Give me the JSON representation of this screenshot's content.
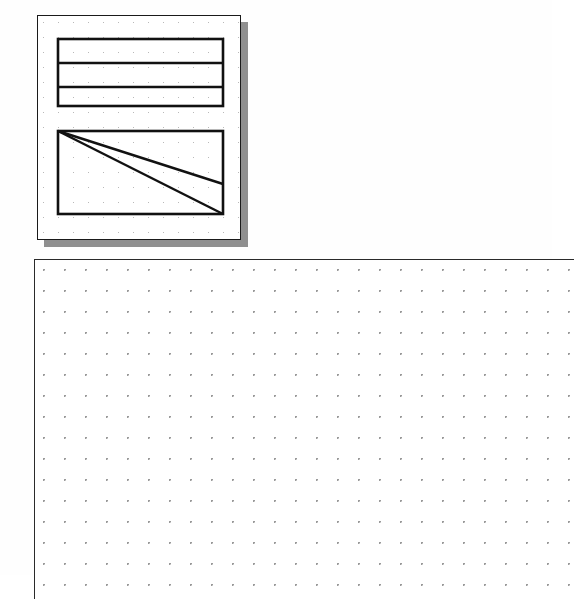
{
  "document": {
    "title": "Drafting Sheet",
    "background_color": "#fefefe",
    "ink_color": "#1a1a1a",
    "grid_dot_color": "#9a9a9a",
    "shadow_color": "#8f8f8f"
  },
  "detail_panel": {
    "name": "Detail View",
    "x": 37,
    "y": 15,
    "width": 204,
    "height": 225,
    "border_color": "#1a1a1a",
    "fill_color": "#ffffff",
    "shadow_offset": 7,
    "grid_spacing": 15,
    "grid_dot_color": "#b9b9b9",
    "shapes": [
      {
        "id": "banded-rectangle",
        "type": "rectangle",
        "label": "Banded Rectangle",
        "x": 20,
        "y": 23,
        "width": 165,
        "height": 67,
        "stroke": "#111111",
        "stroke_width": 2.6,
        "fill": "none",
        "divider_count": 2,
        "dividers_y": [
          47,
          71
        ],
        "bands": 3
      },
      {
        "id": "diagonal-rectangle",
        "type": "rectangle",
        "label": "Diagonal Rectangle",
        "x": 20,
        "y": 115,
        "width": 165,
        "height": 83,
        "stroke": "#111111",
        "stroke_width": 2.6,
        "fill": "none",
        "diagonals": [
          {
            "id": "upper-diagonal",
            "x1": 20,
            "y1": 115,
            "x2": 185,
            "y2": 168
          },
          {
            "id": "lower-diagonal",
            "x1": 20,
            "y1": 115,
            "x2": 185,
            "y2": 198
          }
        ]
      }
    ]
  },
  "main_canvas": {
    "name": "Drawing Canvas",
    "x": 34,
    "y": 259,
    "width": 540,
    "height": 340,
    "grid_spacing": 21,
    "grid_dot_color": "#9a9a9a",
    "border_color": "#2a2a2a",
    "fill_color": "#ffffff",
    "contents": "empty"
  }
}
